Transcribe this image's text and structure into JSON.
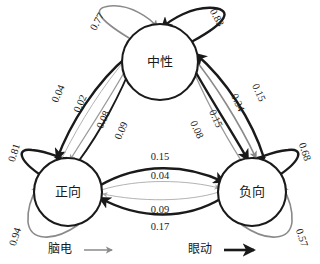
{
  "figure": {
    "type": "state-transition-diagram",
    "background": "#ffffff",
    "colors": {
      "eeg": "#8a8a8a",
      "eye": "#1a1a1a"
    }
  },
  "nodes": [
    {
      "id": "neutral",
      "label": "中性",
      "cx": 160,
      "cy": 62,
      "r": 38
    },
    {
      "id": "positive",
      "label": "正向",
      "cx": 68,
      "cy": 192,
      "r": 34
    },
    {
      "id": "negative",
      "label": "负向",
      "cx": 252,
      "cy": 192,
      "r": 34
    }
  ],
  "self_loops": [
    {
      "node": "neutral",
      "modality": "eeg",
      "weight": "0.77",
      "lx": 98,
      "ly": 22,
      "rot": -62
    },
    {
      "node": "neutral",
      "modality": "eye",
      "weight": "0.83",
      "lx": 216,
      "ly": 18,
      "rot": 62
    },
    {
      "node": "positive",
      "modality": "eye",
      "weight": "0.81",
      "lx": 15,
      "ly": 153,
      "rot": -72
    },
    {
      "node": "positive",
      "modality": "eeg",
      "weight": "0.94",
      "lx": 16,
      "ly": 237,
      "rot": -72
    },
    {
      "node": "negative",
      "modality": "eye",
      "weight": "0.68",
      "lx": 304,
      "ly": 152,
      "rot": 72
    },
    {
      "node": "negative",
      "modality": "eeg",
      "weight": "0.57",
      "lx": 301,
      "ly": 238,
      "rot": 72
    }
  ],
  "edges": [
    {
      "from": "neutral",
      "to": "positive",
      "modality": "eye",
      "weight": "0.04",
      "lx": 59,
      "ly": 94,
      "rot": -66
    },
    {
      "from": "positive",
      "to": "neutral",
      "modality": "eeg",
      "weight": "0.02",
      "lx": 81,
      "ly": 104,
      "rot": -66
    },
    {
      "from": "neutral",
      "to": "positive",
      "modality": "eeg",
      "weight": "0.08",
      "lx": 104,
      "ly": 120,
      "rot": -66
    },
    {
      "from": "positive",
      "to": "neutral",
      "modality": "eye",
      "weight": "0.09",
      "lx": 122,
      "ly": 131,
      "rot": -66
    },
    {
      "from": "positive",
      "to": "negative",
      "modality": "eye",
      "weight": "0.15",
      "lx": 160,
      "ly": 158
    },
    {
      "from": "positive",
      "to": "negative",
      "modality": "eeg",
      "weight": "0.04",
      "lx": 160,
      "ly": 177
    },
    {
      "from": "negative",
      "to": "positive",
      "modality": "eeg",
      "weight": "0.09",
      "lx": 160,
      "ly": 211
    },
    {
      "from": "negative",
      "to": "positive",
      "modality": "eye",
      "weight": "0.17",
      "lx": 160,
      "ly": 228
    },
    {
      "from": "neutral",
      "to": "negative",
      "modality": "eye",
      "weight": "0.08",
      "lx": 196,
      "ly": 130,
      "rot": 66
    },
    {
      "from": "negative",
      "to": "neutral",
      "modality": "eeg",
      "weight": "0.15",
      "lx": 215,
      "ly": 119,
      "rot": 66
    },
    {
      "from": "neutral",
      "to": "negative",
      "modality": "eeg",
      "weight": "0.34",
      "lx": 237,
      "ly": 103,
      "rot": 66
    },
    {
      "from": "negative",
      "to": "neutral",
      "modality": "eye",
      "weight": "0.15",
      "lx": 258,
      "ly": 93,
      "rot": 66
    }
  ],
  "legend": {
    "items": [
      {
        "id": "eeg",
        "label": "脑电",
        "color": "#8a8a8a",
        "tx": 60,
        "ty": 250
      },
      {
        "id": "eye",
        "label": "眼动",
        "color": "#1a1a1a",
        "tx": 200,
        "ty": 250
      }
    ]
  }
}
